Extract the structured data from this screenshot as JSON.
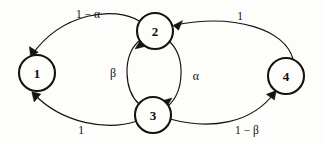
{
  "figure": {
    "type": "state-transition-diagram",
    "background_color": "#fdfdfc",
    "stroke_color": "#15120f",
    "width": 322,
    "height": 143
  },
  "nodes": [
    {
      "id": "1",
      "label": "1",
      "cx": 37,
      "cy": 73,
      "r": 18
    },
    {
      "id": "2",
      "label": "2",
      "cx": 155,
      "cy": 31,
      "r": 18
    },
    {
      "id": "3",
      "label": "3",
      "cx": 153,
      "cy": 115,
      "r": 18
    },
    {
      "id": "4",
      "label": "4",
      "cx": 286,
      "cy": 76,
      "r": 18
    }
  ],
  "edges": [
    {
      "id": "e-2-1",
      "from": "2",
      "to": "1",
      "label": "1 − α",
      "label_x": 88,
      "label_y": 14,
      "label_kind": "expression"
    },
    {
      "id": "e-4-2",
      "from": "4",
      "to": "2",
      "label": "1",
      "label_x": 240,
      "label_y": 16,
      "label_kind": "number"
    },
    {
      "id": "e-3-2",
      "from": "3",
      "to": "2",
      "label": "β",
      "label_x": 113,
      "label_y": 73,
      "label_kind": "greek"
    },
    {
      "id": "e-2-3",
      "from": "2",
      "to": "3",
      "label": "α",
      "label_x": 196,
      "label_y": 76,
      "label_kind": "greek"
    },
    {
      "id": "e-3-1",
      "from": "3",
      "to": "1",
      "label": "1",
      "label_x": 81,
      "label_y": 130,
      "label_kind": "number"
    },
    {
      "id": "e-3-4",
      "from": "3",
      "to": "4",
      "label": "1 − β",
      "label_x": 247,
      "label_y": 130,
      "label_kind": "expression"
    }
  ]
}
